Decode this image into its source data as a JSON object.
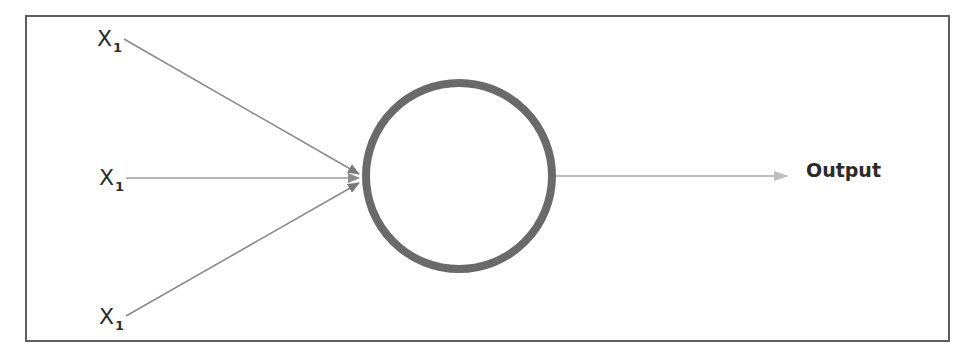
{
  "diagram": {
    "type": "perceptron",
    "inputs": [
      {
        "label": "X",
        "subscript": "1"
      },
      {
        "label": "X",
        "subscript": "1"
      },
      {
        "label": "X",
        "subscript": "1"
      }
    ],
    "node": {
      "shape": "circle"
    },
    "output": {
      "label": "Output"
    },
    "colors": {
      "frame": "#5e5e5e",
      "node_stroke": "#6a6a6a",
      "input_arrows": "#8a8a8a",
      "middle_arrow": "#b5b5b5",
      "output_arrow": "#b0b0b0",
      "text": "#2b2b2b"
    }
  }
}
